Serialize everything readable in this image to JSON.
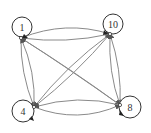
{
  "diagram": {
    "type": "directed-graph",
    "nodes": [
      {
        "id": "1",
        "label": "1",
        "cx": 22,
        "cy": 27,
        "ax": 21,
        "ay": 38
      },
      {
        "id": "10",
        "label": "10",
        "cx": 113,
        "cy": 24,
        "ax": 110,
        "ay": 34
      },
      {
        "id": "4",
        "label": "4",
        "cx": 23,
        "cy": 111,
        "ax": 34,
        "ay": 107
      },
      {
        "id": "8",
        "label": "8",
        "cx": 130,
        "cy": 107,
        "ax": 120,
        "ay": 105
      }
    ],
    "edges": [
      {
        "from": "1",
        "to": "10"
      },
      {
        "from": "10",
        "to": "1"
      },
      {
        "from": "1",
        "to": "4"
      },
      {
        "from": "4",
        "to": "1"
      },
      {
        "from": "1",
        "to": "8"
      },
      {
        "from": "8",
        "to": "1"
      },
      {
        "from": "10",
        "to": "4"
      },
      {
        "from": "4",
        "to": "10"
      },
      {
        "from": "10",
        "to": "8"
      },
      {
        "from": "8",
        "to": "10"
      },
      {
        "from": "4",
        "to": "8"
      },
      {
        "from": "8",
        "to": "4"
      }
    ],
    "colors": {
      "edge": "#8a8a8a",
      "node_stroke": "#333333",
      "arrow": "#222222"
    }
  }
}
